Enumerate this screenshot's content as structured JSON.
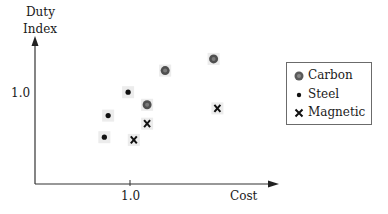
{
  "chart_data": {
    "type": "scatter",
    "title": "",
    "xlabel": "Cost",
    "ylabel": "Duty Index",
    "ylabel_lines": [
      "Duty",
      "Index"
    ],
    "x_ticks": [
      {
        "value": 1.0,
        "label": "1.0"
      }
    ],
    "y_ticks": [
      {
        "value": 1.0,
        "label": "1.0"
      }
    ],
    "xlim": [
      0,
      1.55
    ],
    "ylim": [
      0,
      1.65
    ],
    "grid": false,
    "legend_position": "right",
    "series": [
      {
        "name": "Carbon",
        "marker": "circle-large",
        "color": "#555555",
        "points": [
          [
            1.18,
            0.88
          ],
          [
            1.37,
            1.26
          ],
          [
            1.88,
            1.39
          ]
        ]
      },
      {
        "name": "Steel",
        "marker": "dot",
        "color": "#111111",
        "points": [
          [
            0.98,
            1.02
          ],
          [
            0.77,
            0.76
          ],
          [
            0.73,
            0.52
          ]
        ]
      },
      {
        "name": "Magnetic",
        "marker": "x",
        "color": "#111111",
        "points": [
          [
            1.18,
            0.67
          ],
          [
            1.04,
            0.49
          ],
          [
            1.92,
            0.84
          ]
        ]
      }
    ]
  },
  "axes": {
    "y_title_line1": "Duty",
    "y_title_line2": "Index",
    "y_tick_label": "1.0",
    "x_tick_label": "1.0",
    "x_title": "Cost"
  },
  "legend": {
    "items": [
      {
        "label": "Carbon",
        "icon": "carbon-marker"
      },
      {
        "label": "Steel",
        "icon": "steel-marker"
      },
      {
        "label": "Magnetic",
        "icon": "magnetic-marker"
      }
    ]
  }
}
